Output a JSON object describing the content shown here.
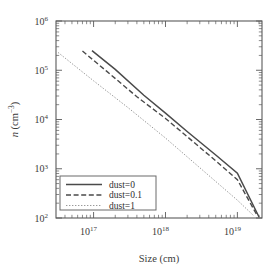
{
  "chart_data": {
    "type": "line",
    "title": "",
    "xlabel": "Size (cm)",
    "ylabel": "n (cm-3)",
    "ylabel_base": "n",
    "ylabel_unit_open": " (cm",
    "ylabel_unit_exp": "−3",
    "ylabel_unit_close": ")",
    "xscale": "log",
    "yscale": "log",
    "xlim": [
      3e+16,
      2.2e+19
    ],
    "ylim": [
      100,
      1000000
    ],
    "grid": false,
    "legend_position": "lower left",
    "xticks": [
      {
        "value": 1e+17,
        "label_base": "10",
        "label_exp": "17"
      },
      {
        "value": 1e+18,
        "label_base": "10",
        "label_exp": "18"
      },
      {
        "value": 1e+19,
        "label_base": "10",
        "label_exp": "19"
      }
    ],
    "yticks": [
      {
        "value": 100,
        "label_base": "10",
        "label_exp": "2"
      },
      {
        "value": 1000,
        "label_base": "10",
        "label_exp": "3"
      },
      {
        "value": 10000,
        "label_base": "10",
        "label_exp": "4"
      },
      {
        "value": 100000,
        "label_base": "10",
        "label_exp": "5"
      },
      {
        "value": 1000000,
        "label_base": "10",
        "label_exp": "6"
      }
    ],
    "series": [
      {
        "name": "dust=0",
        "style": "solid",
        "color": "#4a4a4a",
        "x": [
          9.5e+16,
          2e+17,
          5e+17,
          1e+18,
          2e+18,
          5e+18,
          1e+19,
          2e+19
        ],
        "y": [
          250000,
          104000,
          31000,
          13500,
          5700,
          1900,
          810,
          105
        ]
      },
      {
        "name": "dust=0.1",
        "style": "dashed",
        "color": "#4a4a4a",
        "x": [
          7e+16,
          1.5e+17,
          4e+17,
          1e+18,
          2e+18,
          5e+18,
          1e+19,
          1.9e+19
        ],
        "y": [
          245000,
          97000,
          29000,
          10500,
          4500,
          1450,
          600,
          110
        ]
      },
      {
        "name": "dust=1",
        "style": "dotted",
        "color": "#9a9a9a",
        "x": [
          3.2e+16,
          1e+17,
          3e+17,
          1e+18,
          3e+18,
          1e+19,
          1.7e+19
        ],
        "y": [
          230000,
          61000,
          17500,
          4200,
          1050,
          230,
          110
        ]
      }
    ]
  },
  "legend": {
    "entries": [
      {
        "label": "dust=0",
        "style": "solid"
      },
      {
        "label": "dust=0.1",
        "style": "dashed"
      },
      {
        "label": "dust=1",
        "style": "dotted"
      }
    ]
  }
}
